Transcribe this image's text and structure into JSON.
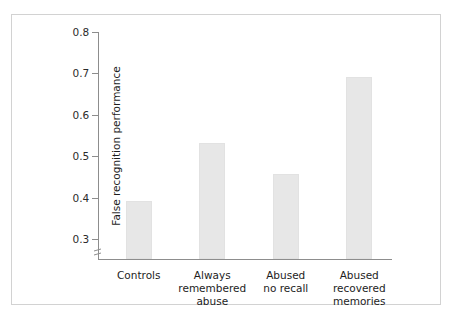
{
  "chart_data": {
    "type": "bar",
    "title": "",
    "subtitle": "",
    "xlabel": "",
    "ylabel": "False recognition performance",
    "categories": [
      "Controls",
      "Always\nremembered\nabuse",
      "Abused\nno recall",
      "Abused\nrecovered\nmemories"
    ],
    "values": [
      0.39,
      0.53,
      0.455,
      0.69
    ],
    "ylim": [
      0.25,
      0.8
    ],
    "yticks": [
      0.3,
      0.4,
      0.5,
      0.6,
      0.7,
      0.8
    ],
    "ytick_labels": [
      "0.3",
      "0.4",
      "0.5",
      "0.6",
      "0.7",
      "0.8"
    ],
    "axis_break": true,
    "axis_break_position": 0.27,
    "grid": false,
    "legend": null,
    "bar_color": "#e7e7e7",
    "axis_color": "#8d8d8d",
    "frame_color": "#d2d2d2",
    "text_color": "#1d1d1d"
  }
}
